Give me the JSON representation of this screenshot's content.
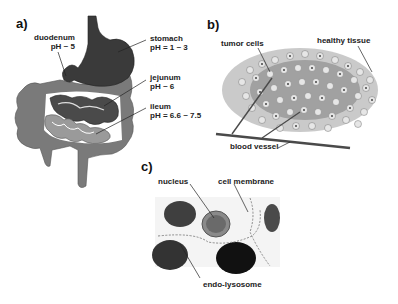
{
  "panels": {
    "a": {
      "label": "a)",
      "title": "Digestive tract pH",
      "annotations": [
        {
          "name": "duodenum",
          "line1": "duodenum",
          "line2": "pH ~ 5"
        },
        {
          "name": "stomach",
          "line1": "stomach",
          "line2": "pH = 1 ~ 3"
        },
        {
          "name": "jejunum",
          "line1": "jejunum",
          "line2": "pH ~ 6"
        },
        {
          "name": "ileum",
          "line1": "ileum",
          "line2": "pH = 6.6 ~ 7.5"
        }
      ]
    },
    "b": {
      "label": "b)",
      "title": "Tumor tissue",
      "annotations": [
        {
          "name": "tumor-cells",
          "text": "tumor cells"
        },
        {
          "name": "healthy-tissue",
          "text": "healthy tissue"
        },
        {
          "name": "blood-vessel",
          "text": "blood vessel"
        }
      ]
    },
    "c": {
      "label": "c)",
      "title": "Cell micrograph",
      "annotations": [
        {
          "name": "nucleus",
          "text": "nucleus"
        },
        {
          "name": "cell-membrane",
          "text": "cell membrane"
        },
        {
          "name": "endo-lysosome",
          "text": "endo-lysosome"
        }
      ]
    }
  },
  "colors": {
    "stomach": "#3a3a3a",
    "colon": "#7a7a7a",
    "small_intestine_dark": "#4a4a4a",
    "small_intestine_light": "#9a9a9a",
    "tumor_cell": "#9c9c9c",
    "vessel": "#4a4a4a",
    "label": "#222222"
  }
}
